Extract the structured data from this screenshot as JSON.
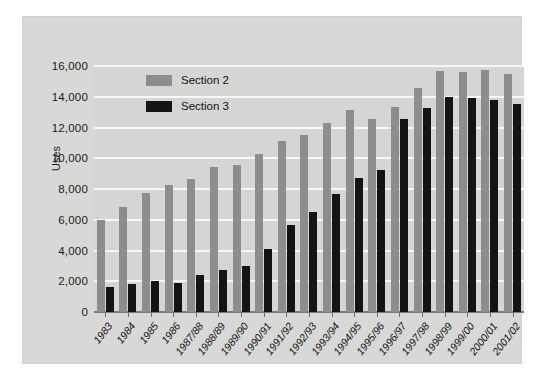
{
  "chart_data": {
    "type": "bar",
    "title": "",
    "xlabel": "",
    "ylabel": "Uses",
    "ylim": [
      0,
      16000
    ],
    "ytick_step": 2000,
    "yticks": [
      "16,000",
      "14,000",
      "12,000",
      "10,000",
      "8,000",
      "6,000",
      "4,000",
      "2,000",
      "0"
    ],
    "grid": "horizontal",
    "legend_position": "top-left",
    "categories": [
      "1983",
      "1984",
      "1985",
      "1986",
      "1987/88",
      "1988/89",
      "1989/90",
      "1990/91",
      "1991/92",
      "1992/93",
      "1993/94",
      "1994/95",
      "1995/96",
      "1996/97",
      "1997/98",
      "1998/99",
      "1999/00",
      "2000/01",
      "2001/02"
    ],
    "series": [
      {
        "name": "Section 2",
        "color": "#8d8d8b",
        "values": [
          6000,
          6800,
          7750,
          8250,
          8650,
          9400,
          9550,
          10250,
          11150,
          11500,
          12300,
          13150,
          12550,
          13350,
          14550,
          15650,
          15600,
          15750,
          15500
        ]
      },
      {
        "name": "Section 3",
        "color": "#141414",
        "values": [
          1650,
          1800,
          2000,
          1900,
          2400,
          2750,
          3000,
          4100,
          5650,
          6500,
          7650,
          8700,
          9250,
          12550,
          13300,
          14000,
          13900,
          13800,
          13550
        ]
      }
    ]
  },
  "legend": {
    "items": [
      {
        "label": "Section 2"
      },
      {
        "label": "Section 3"
      }
    ]
  },
  "colors": {
    "section2": "#8d8d8b",
    "section3": "#141414",
    "plot_background": "#d5d5d3",
    "panel_background": "#d8d8d6",
    "gridline": "#f7f7f5"
  }
}
